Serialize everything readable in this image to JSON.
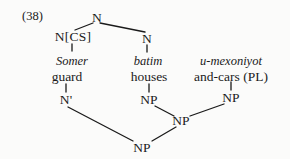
{
  "figure": {
    "example_number": "(38)",
    "type": "syntax-tree",
    "ink_color": "#1a1a1a",
    "background_color": "#fbfbfa"
  },
  "nodes": {
    "root_n": "N",
    "construct_n": "N[CS]",
    "right_n": "N",
    "n_bar": "N'",
    "np_middle_upper": "NP",
    "np_right_upper": "NP",
    "np_mid": "NP",
    "np_root": "NP"
  },
  "columns": [
    {
      "gloss": "Somer",
      "translation": "guard"
    },
    {
      "gloss": "batim",
      "translation": "houses"
    },
    {
      "gloss": "u-mexoniyot",
      "translation": "and-cars (PL)"
    }
  ]
}
